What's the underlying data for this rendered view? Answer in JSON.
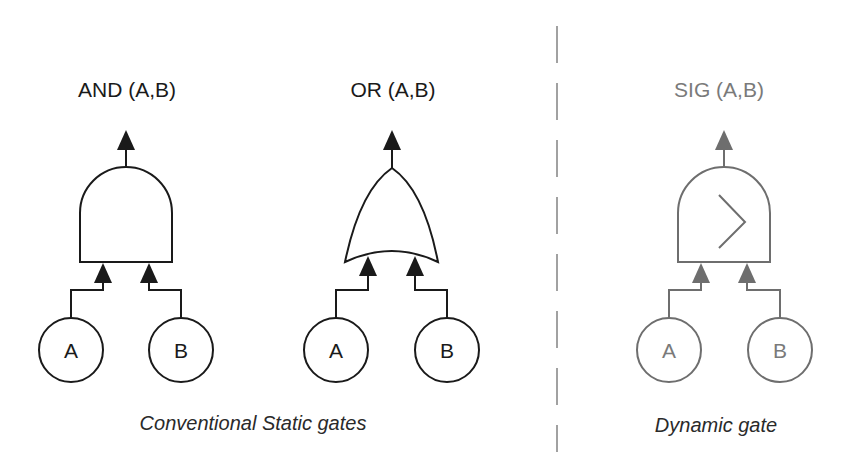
{
  "colors": {
    "static_stroke": "#1a1a1a",
    "dynamic_stroke": "#6e6e6e",
    "divider": "#8a8a8a",
    "background": "#ffffff"
  },
  "gates": [
    {
      "id": "and",
      "title": "AND (A,B)",
      "type": "AND",
      "inputs": [
        "A",
        "B"
      ]
    },
    {
      "id": "or",
      "title": "OR (A,B)",
      "type": "OR",
      "inputs": [
        "A",
        "B"
      ]
    },
    {
      "id": "sig",
      "title": "SIG (A,B)",
      "type": "SIG",
      "symbol": "greater-than",
      "inputs": [
        "A",
        "B"
      ]
    }
  ],
  "captions": {
    "static": "Conventional Static gates",
    "dynamic": "Dynamic gate"
  },
  "divider": {
    "style": "dashed"
  }
}
